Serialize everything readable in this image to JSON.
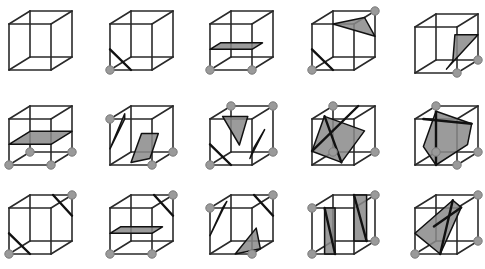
{
  "figure": {
    "rows": 3,
    "cols": 5,
    "colors": {
      "edge": "#2a2a2a",
      "surface": "#8a8a8a",
      "vertex": "#9a9a9a",
      "background": "#ffffff"
    },
    "cube_size": {
      "w": 42,
      "h": 46,
      "dx": 21,
      "dy": -13
    }
  },
  "cubes": [
    {
      "id": 0,
      "origin": [
        9,
        70
      ],
      "vertices": [],
      "polys": [],
      "cuts": []
    },
    {
      "id": 1,
      "origin": [
        110,
        70
      ],
      "vertices": [
        [
          0,
          0,
          0
        ]
      ],
      "polys": [],
      "cuts": [
        [
          [
            0,
            0.45,
            0
          ],
          [
            0.5,
            0,
            0
          ]
        ]
      ]
    },
    {
      "id": 2,
      "origin": [
        210,
        70
      ],
      "vertices": [
        [
          0,
          0,
          0
        ],
        [
          1,
          0,
          0
        ]
      ],
      "polys": [
        [
          [
            0,
            0.45,
            0
          ],
          [
            1,
            0.45,
            0
          ],
          [
            1,
            0.45,
            0.5
          ],
          [
            0,
            0.45,
            0.5
          ]
        ]
      ],
      "cuts": []
    },
    {
      "id": 3,
      "origin": [
        312,
        70
      ],
      "vertices": [
        [
          0,
          0,
          0
        ],
        [
          1,
          1,
          1
        ]
      ],
      "polys": [
        [
          [
            0.5,
            1,
            0
          ],
          [
            1,
            1,
            0.5
          ],
          [
            1,
            0.45,
            1
          ]
        ]
      ],
      "cuts": [
        [
          [
            0,
            0.45,
            0
          ],
          [
            0.5,
            0,
            0
          ]
        ]
      ]
    },
    {
      "id": 4,
      "origin": [
        415,
        73
      ],
      "vertices": [
        [
          1,
          0,
          0
        ],
        [
          1,
          0,
          1
        ]
      ],
      "polys": [
        [
          [
            0.45,
            0.55,
            1
          ],
          [
            1,
            0.55,
            1
          ],
          [
            0.6,
            0,
            0.3
          ],
          [
            0.45,
            0,
            0.9
          ]
        ]
      ],
      "cuts": []
    },
    {
      "id": 5,
      "origin": [
        9,
        165
      ],
      "vertices": [
        [
          0,
          0,
          0
        ],
        [
          1,
          0,
          0
        ],
        [
          0,
          0,
          1
        ],
        [
          1,
          0,
          1
        ]
      ],
      "polys": [
        [
          [
            0,
            0.45,
            0
          ],
          [
            1,
            0.45,
            0
          ],
          [
            1,
            0.45,
            1
          ],
          [
            0,
            0.45,
            1
          ]
        ]
      ],
      "cuts": []
    },
    {
      "id": 6,
      "origin": [
        110,
        165
      ],
      "vertices": [
        [
          0,
          1,
          0
        ],
        [
          1,
          0,
          0
        ],
        [
          1,
          0,
          1
        ]
      ],
      "polys": [
        [
          [
            0,
            0.35,
            0
          ],
          [
            0.35,
            1,
            0
          ],
          [
            0.15,
            1,
            0.4
          ]
        ],
        [
          [
            0.6,
            0.6,
            0.3
          ],
          [
            1,
            0.6,
            0.3
          ],
          [
            0.7,
            0,
            0.5
          ],
          [
            0.4,
            0,
            0.2
          ]
        ]
      ],
      "cuts": []
    },
    {
      "id": 7,
      "origin": [
        210,
        165
      ],
      "vertices": [
        [
          0,
          0,
          0
        ],
        [
          0,
          1,
          1
        ],
        [
          1,
          1,
          1
        ],
        [
          1,
          0,
          1
        ]
      ],
      "polys": [
        [
          [
            0.2,
            1,
            0.2
          ],
          [
            0.8,
            1,
            0.2
          ],
          [
            0.55,
            0.35,
            0.3
          ]
        ],
        [
          [
            0.9,
            0.3,
            0.3
          ],
          [
            1,
            0.6,
            0.6
          ],
          [
            0.7,
            0,
            0.5
          ]
        ]
      ],
      "cuts": [
        [
          [
            0,
            0.45,
            0
          ],
          [
            0.5,
            0,
            0
          ]
        ]
      ]
    },
    {
      "id": 8,
      "origin": [
        312,
        165
      ],
      "vertices": [
        [
          0,
          1,
          1
        ],
        [
          0,
          0,
          1
        ],
        [
          1,
          0,
          1
        ]
      ],
      "polys": [
        [
          [
            0.2,
            1,
            0.2
          ],
          [
            1,
            0.6,
            0.5
          ],
          [
            0.6,
            0,
            0.2
          ],
          [
            0,
            0.3,
            0
          ],
          [
            0,
            0.9,
            0.6
          ]
        ]
      ],
      "cuts": [
        [
          [
            0.2,
            1,
            0.2
          ],
          [
            0.6,
            0,
            0.2
          ]
        ],
        [
          [
            0.6,
            1,
            1
          ],
          [
            0,
            0.3,
            0
          ]
        ]
      ]
    },
    {
      "id": 9,
      "origin": [
        415,
        165
      ],
      "vertices": [
        [
          0,
          1,
          1
        ],
        [
          0,
          0,
          1
        ],
        [
          1,
          0,
          1
        ],
        [
          1,
          0,
          0
        ]
      ],
      "polys": [
        [
          [
            0.2,
            1,
            0.6
          ],
          [
            1,
            0.7,
            0.7
          ],
          [
            1,
            0.3,
            0.5
          ],
          [
            0.5,
            0,
            0
          ],
          [
            0.2,
            0.4,
            0
          ]
        ]
      ],
      "cuts": [
        [
          [
            0.2,
            1,
            0.6
          ],
          [
            0.5,
            0,
            0
          ]
        ],
        [
          [
            0.2,
            1,
            0
          ],
          [
            1,
            0.7,
            0.7
          ]
        ]
      ]
    },
    {
      "id": 10,
      "origin": [
        9,
        254
      ],
      "vertices": [
        [
          0,
          0,
          0
        ],
        [
          1,
          1,
          1
        ]
      ],
      "polys": [],
      "cuts": [
        [
          [
            0,
            0.45,
            0
          ],
          [
            0.5,
            0,
            0
          ]
        ],
        [
          [
            0.55,
            1,
            1
          ],
          [
            1,
            0.55,
            1
          ]
        ]
      ]
    },
    {
      "id": 11,
      "origin": [
        110,
        254
      ],
      "vertices": [
        [
          0,
          0,
          0
        ],
        [
          1,
          0,
          0
        ],
        [
          1,
          1,
          1
        ]
      ],
      "polys": [
        [
          [
            0,
            0.45,
            0
          ],
          [
            1,
            0.45,
            0
          ],
          [
            1,
            0.45,
            0.5
          ],
          [
            0,
            0.45,
            0.5
          ]
        ]
      ],
      "cuts": [
        [
          [
            0.55,
            1,
            1
          ],
          [
            1,
            0.55,
            1
          ]
        ]
      ]
    },
    {
      "id": 12,
      "origin": [
        210,
        254
      ],
      "vertices": [
        [
          0,
          1,
          0
        ],
        [
          1,
          1,
          1
        ],
        [
          1,
          0,
          0
        ]
      ],
      "polys": [
        [
          [
            0,
            0.4,
            0
          ],
          [
            0.3,
            1,
            0
          ],
          [
            0.15,
            1,
            0.5
          ]
        ],
        [
          [
            0.6,
            0,
            0
          ],
          [
            1,
            0,
            0.4
          ],
          [
            0.9,
            0.45,
            0.4
          ]
        ]
      ],
      "cuts": [
        [
          [
            0.55,
            1,
            1
          ],
          [
            1,
            0.55,
            1
          ]
        ]
      ]
    },
    {
      "id": 13,
      "origin": [
        312,
        254
      ],
      "vertices": [
        [
          0,
          1,
          0
        ],
        [
          0,
          0,
          0
        ],
        [
          1,
          1,
          1
        ],
        [
          1,
          0,
          1
        ]
      ],
      "polys": [
        [
          [
            0.3,
            1,
            0
          ],
          [
            0.3,
            0,
            0
          ],
          [
            0.55,
            0,
            0
          ],
          [
            0.55,
            1,
            0
          ]
        ],
        [
          [
            0.5,
            1,
            1
          ],
          [
            0.5,
            0,
            1
          ],
          [
            0.8,
            0,
            1
          ],
          [
            0.8,
            1,
            1
          ]
        ]
      ],
      "cuts": [
        [
          [
            0.3,
            1,
            0
          ],
          [
            0.55,
            0,
            0
          ]
        ],
        [
          [
            0.5,
            1,
            1
          ],
          [
            0.8,
            0,
            1
          ]
        ]
      ]
    },
    {
      "id": 14,
      "origin": [
        415,
        254
      ],
      "vertices": [
        [
          0,
          0,
          0
        ],
        [
          1,
          1,
          1
        ],
        [
          1,
          0,
          1
        ]
      ],
      "polys": [
        [
          [
            0,
            0.45,
            0
          ],
          [
            0.6,
            0,
            0
          ],
          [
            0.9,
            0.9,
            0.4
          ],
          [
            0.6,
            1,
            0.6
          ]
        ]
      ],
      "cuts": [
        [
          [
            0.6,
            1,
            0.6
          ],
          [
            0.6,
            0,
            0
          ]
        ],
        [
          [
            0.9,
            0.9,
            0.4
          ],
          [
            0.45,
            0.6,
            0
          ]
        ]
      ]
    }
  ]
}
